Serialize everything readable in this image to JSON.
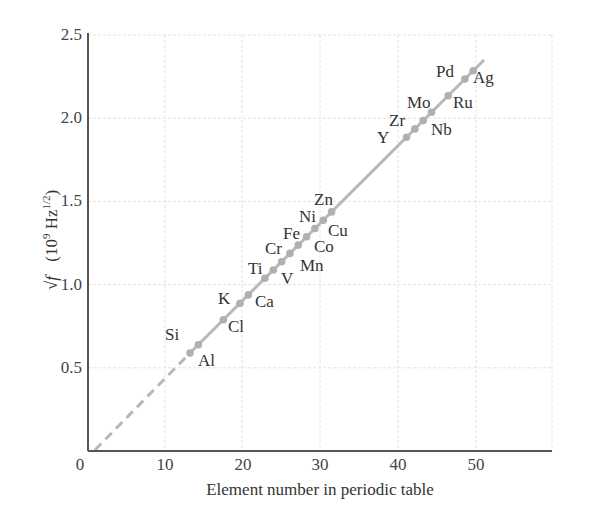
{
  "chart_data": {
    "type": "line",
    "title": "",
    "xlabel": "Element number in periodic table",
    "ylabel": "√f  (10⁹ Hz^1/2)",
    "ylabel_parts": {
      "root": "√f",
      "units_open": "(10",
      "exp9": "9",
      "hz": " Hz",
      "exp": "1/2",
      "close": ")"
    },
    "xlim": [
      0,
      60
    ],
    "ylim": [
      0,
      2.5
    ],
    "xticks": [
      "0",
      "10",
      "20",
      "30",
      "40",
      "50"
    ],
    "yticks": [
      "0",
      "0.5",
      "1.0",
      "1.5",
      "2.0",
      "2.5"
    ],
    "grid": true,
    "legend": null,
    "fit_line": {
      "style": "solid",
      "extrapolation": "dashed",
      "x_start": 1,
      "x_end": 48,
      "slope": 0.0497
    },
    "points": [
      {
        "el": "Al",
        "z": 13,
        "v": 0.59
      },
      {
        "el": "Si",
        "z": 14,
        "v": 0.64
      },
      {
        "el": "Cl",
        "z": 17,
        "v": 0.79
      },
      {
        "el": "K",
        "z": 19,
        "v": 0.89
      },
      {
        "el": "Ca",
        "z": 20,
        "v": 0.94
      },
      {
        "el": "Ti",
        "z": 22,
        "v": 1.04
      },
      {
        "el": "V",
        "z": 23,
        "v": 1.09
      },
      {
        "el": "Cr",
        "z": 24,
        "v": 1.14
      },
      {
        "el": "Mn",
        "z": 25,
        "v": 1.19
      },
      {
        "el": "Fe",
        "z": 26,
        "v": 1.24
      },
      {
        "el": "Co",
        "z": 27,
        "v": 1.29
      },
      {
        "el": "Ni",
        "z": 28,
        "v": 1.34
      },
      {
        "el": "Cu",
        "z": 29,
        "v": 1.39
      },
      {
        "el": "Zn",
        "z": 30,
        "v": 1.44
      },
      {
        "el": "Y",
        "z": 39,
        "v": 1.88
      },
      {
        "el": "Zr",
        "z": 40,
        "v": 1.93
      },
      {
        "el": "Nb",
        "z": 41,
        "v": 1.98
      },
      {
        "el": "Mo",
        "z": 42,
        "v": 2.03
      },
      {
        "el": "Ru",
        "z": 44,
        "v": 2.13
      },
      {
        "el": "Pd",
        "z": 46,
        "v": 2.23
      },
      {
        "el": "Ag",
        "z": 47,
        "v": 2.28
      }
    ]
  },
  "labels": [
    {
      "text": "Al",
      "x": 198,
      "y": 366
    },
    {
      "text": "Si",
      "x": 165,
      "y": 340
    },
    {
      "text": "Cl",
      "x": 228,
      "y": 332
    },
    {
      "text": "K",
      "x": 218,
      "y": 304
    },
    {
      "text": "Ca",
      "x": 255,
      "y": 307
    },
    {
      "text": "Ti",
      "x": 248,
      "y": 274
    },
    {
      "text": "V",
      "x": 281,
      "y": 284
    },
    {
      "text": "Cr",
      "x": 265,
      "y": 254
    },
    {
      "text": "Mn",
      "x": 300,
      "y": 271
    },
    {
      "text": "Fe",
      "x": 283,
      "y": 239
    },
    {
      "text": "Co",
      "x": 314,
      "y": 252
    },
    {
      "text": "Ni",
      "x": 299,
      "y": 222
    },
    {
      "text": "Cu",
      "x": 328,
      "y": 236
    },
    {
      "text": "Zn",
      "x": 314,
      "y": 205
    },
    {
      "text": "Y",
      "x": 377,
      "y": 143
    },
    {
      "text": "Zr",
      "x": 389,
      "y": 126
    },
    {
      "text": "Nb",
      "x": 431,
      "y": 135
    },
    {
      "text": "Mo",
      "x": 407,
      "y": 108
    },
    {
      "text": "Ru",
      "x": 453,
      "y": 108
    },
    {
      "text": "Pd",
      "x": 436,
      "y": 77
    },
    {
      "text": "Ag",
      "x": 473,
      "y": 83
    }
  ],
  "colors": {
    "axis": "#555555",
    "grid": "#e2e2e2",
    "line": "#b8b8b8",
    "point": "#b0b0b0",
    "text": "#333333"
  }
}
